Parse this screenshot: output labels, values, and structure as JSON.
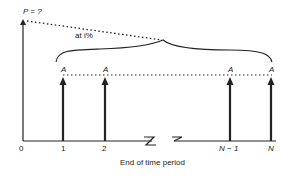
{
  "diagram": {
    "present_value_label": "P = ?",
    "interest_label": "at i%",
    "payment_label": "A",
    "x_axis_label": "End of time period",
    "ticks": [
      "0",
      "1",
      "2",
      "N − 1",
      "N"
    ],
    "payments": [
      {
        "period": "1",
        "label": "A"
      },
      {
        "period": "2",
        "label": "A"
      },
      {
        "period": "N − 1",
        "label": "A"
      },
      {
        "period": "N",
        "label": "A"
      }
    ],
    "colors": {
      "ink": "#222222",
      "background": "#ffffff"
    }
  }
}
